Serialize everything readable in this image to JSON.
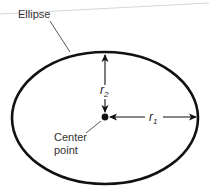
{
  "diagram": {
    "type": "labeled-geometry",
    "subject": "ellipse",
    "labels": {
      "shape": "Ellipse",
      "center_line1": "Center",
      "center_line2": "point",
      "r1_var": "r",
      "r1_sub": "1",
      "r2_var": "r",
      "r2_sub": "2"
    },
    "colors": {
      "stroke": "#111111",
      "leader": "#444444",
      "text": "#333333",
      "background": "#ffffff",
      "edge_line": "#cfcfcf"
    }
  }
}
